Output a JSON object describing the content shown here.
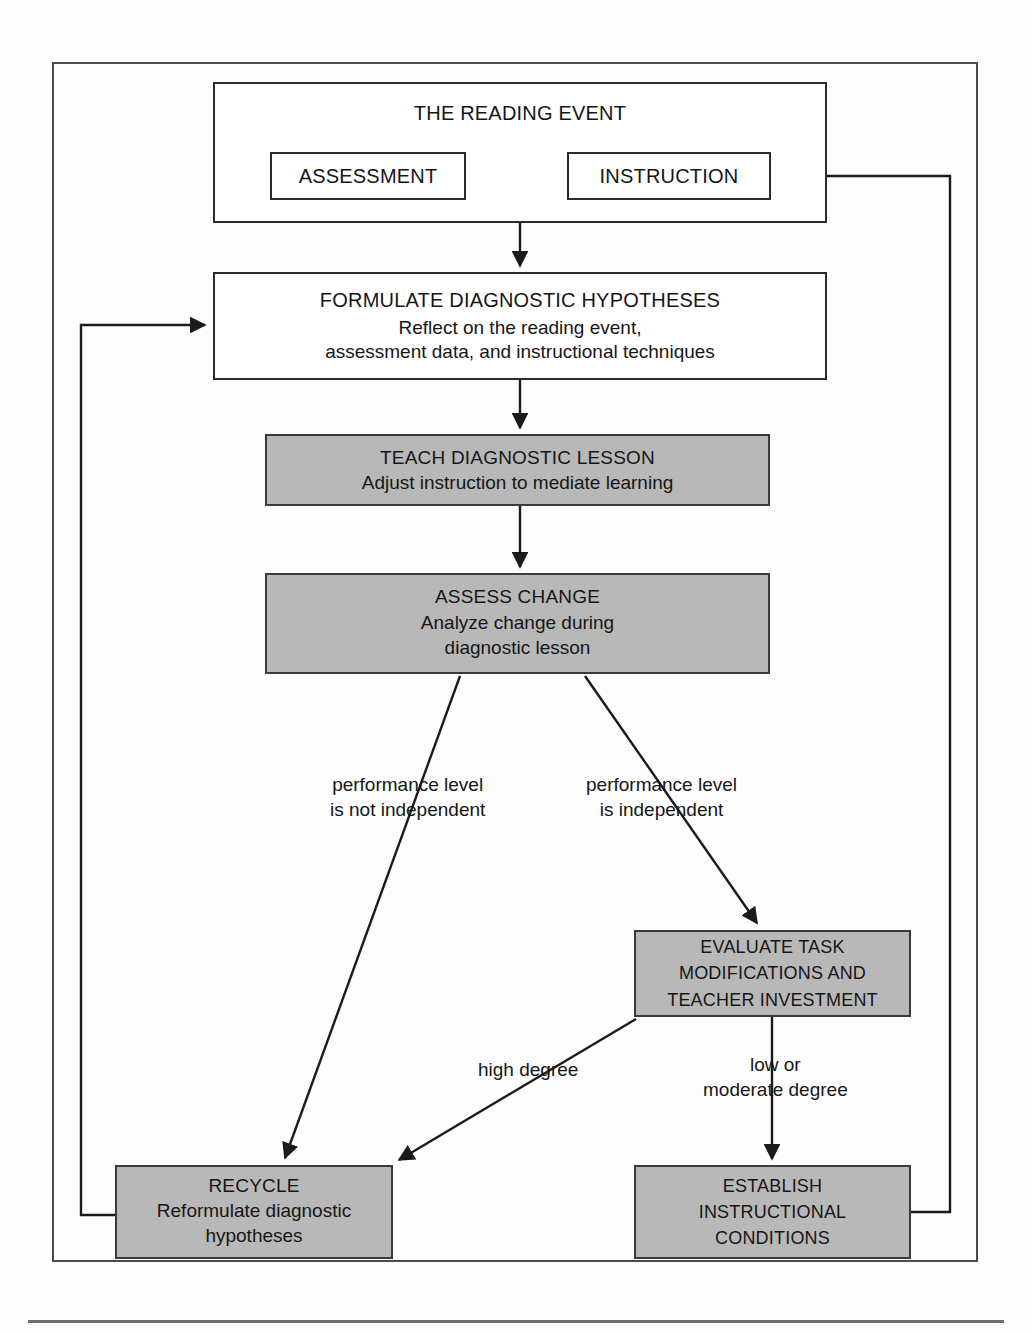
{
  "diagram": {
    "colors": {
      "shaded_fill": "#b8b8b8",
      "box_stroke": "#2b2b2b",
      "frame_stroke": "#4a4a4a",
      "text": "#161616"
    },
    "nodes": {
      "reading_event": {
        "title": "THE READING EVENT",
        "shaded": false
      },
      "assessment": {
        "title": "ASSESSMENT",
        "shaded": false
      },
      "instruction": {
        "title": "INSTRUCTION",
        "shaded": false
      },
      "formulate": {
        "title": "FORMULATE DIAGNOSTIC HYPOTHESES",
        "sub_line1": "Reflect on the reading event,",
        "sub_line2": "assessment data, and instructional techniques",
        "shaded": false
      },
      "teach": {
        "title": "TEACH DIAGNOSTIC LESSON",
        "sub_line1": "Adjust instruction to mediate learning",
        "shaded": true
      },
      "assess_change": {
        "title": "ASSESS CHANGE",
        "sub_line1": "Analyze change during",
        "sub_line2": "diagnostic lesson",
        "shaded": true
      },
      "evaluate": {
        "title_line1": "EVALUATE TASK",
        "title_line2": "MODIFICATIONS AND",
        "title_line3": "TEACHER INVESTMENT",
        "shaded": true
      },
      "recycle": {
        "title": "RECYCLE",
        "sub_line1": "Reformulate diagnostic",
        "sub_line2": "hypotheses",
        "shaded": true
      },
      "establish": {
        "title_line1": "ESTABLISH",
        "title_line2": "INSTRUCTIONAL",
        "title_line3": "CONDITIONS",
        "shaded": true
      }
    },
    "edge_labels": {
      "not_independent_line1": "performance level",
      "not_independent_line2": "is not independent",
      "independent_line1": "performance level",
      "independent_line2": "is independent",
      "high_degree": "high degree",
      "low_moderate_line1": "low or",
      "low_moderate_line2": "moderate degree"
    }
  }
}
